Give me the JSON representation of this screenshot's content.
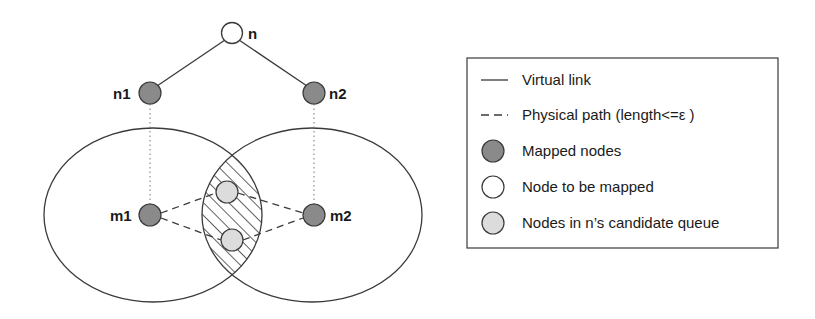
{
  "diagram": {
    "type": "virtual-network-mapping",
    "colors": {
      "mapped_node": "#8a8a8a",
      "node_to_be_mapped": "#ffffff",
      "candidate_node": "#dcdcdc",
      "stroke": "#3a3a3a"
    },
    "tree": {
      "root": {
        "label": "n"
      },
      "children": [
        {
          "label": "n1"
        },
        {
          "label": "n2"
        }
      ]
    },
    "physical": {
      "mapped": [
        {
          "label": "m1"
        },
        {
          "label": "m2"
        }
      ],
      "candidate_count": 2,
      "region_count": 2
    }
  },
  "legend": {
    "items": [
      {
        "symbol": "solid-line",
        "label": "Virtual link"
      },
      {
        "symbol": "dashed-line",
        "label": "Physical path (length<=ε )"
      },
      {
        "symbol": "dark-circle",
        "label": "Mapped nodes"
      },
      {
        "symbol": "white-circle",
        "label": "Node to be mapped"
      },
      {
        "symbol": "light-circle",
        "label": "Nodes in n’s candidate queue"
      }
    ]
  }
}
